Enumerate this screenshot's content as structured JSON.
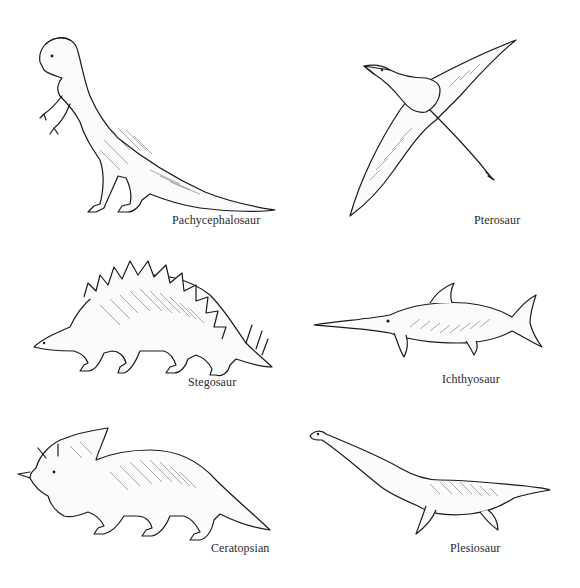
{
  "figure": {
    "background": "#ffffff",
    "ink_color": "#1a1a1a",
    "panels": [
      {
        "id": "pachycephalosaur",
        "label": "Pachycephalosaur",
        "position": "top-left"
      },
      {
        "id": "pterosaur",
        "label": "Pterosaur",
        "position": "top-right"
      },
      {
        "id": "stegosaur",
        "label": "Stegosaur",
        "position": "middle-left"
      },
      {
        "id": "ichthyosaur",
        "label": "Ichthyosaur",
        "position": "middle-right"
      },
      {
        "id": "ceratopsian",
        "label": "Ceratopsian",
        "position": "bottom-left"
      },
      {
        "id": "plesiosaur",
        "label": "Plesiosaur",
        "position": "bottom-right"
      }
    ]
  }
}
